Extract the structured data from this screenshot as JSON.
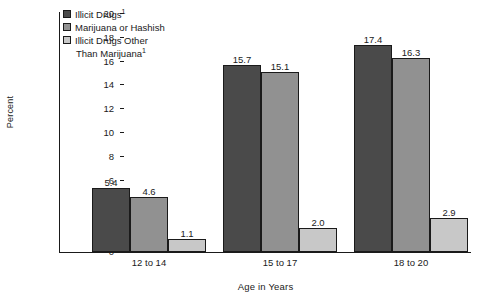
{
  "chart_data": {
    "type": "bar",
    "title": "",
    "xlabel": "Age in Years",
    "ylabel": "Percent",
    "categories": [
      "12 to 14",
      "15 to 17",
      "18 to 20"
    ],
    "series": [
      {
        "name": "Illicit Drugs1",
        "values": [
          5.4,
          15.7,
          17.4
        ],
        "color": "#4a4a4a"
      },
      {
        "name": "Marijuana or Hashish",
        "values": [
          4.6,
          15.1,
          16.3
        ],
        "color": "#919191"
      },
      {
        "name": "Illicit Drugs Other Than Marijuana1",
        "values": [
          1.1,
          2.0,
          2.9
        ],
        "color": "#c8c8c8"
      }
    ],
    "value_labels": [
      [
        "5.4",
        "4.6",
        "1.1"
      ],
      [
        "15.7",
        "15.1",
        "2.0"
      ],
      [
        "17.4",
        "16.3",
        "2.9"
      ]
    ],
    "ylim": [
      0,
      20
    ],
    "ytick_values": [
      20,
      18,
      16,
      14,
      12,
      10,
      8,
      6,
      4,
      2,
      0
    ],
    "ytick_labels": [
      "20",
      "18",
      "16",
      "14",
      "12",
      "10",
      "8",
      "6",
      "4",
      "2",
      "0"
    ],
    "grid": false,
    "legend_position": "top-left"
  },
  "legend": {
    "entries": [
      {
        "label": "Illicit Drugs",
        "footnote": "1",
        "continuation": "",
        "color": "#4a4a4a"
      },
      {
        "label": "Marijuana or Hashish",
        "footnote": "",
        "continuation": "",
        "color": "#919191"
      },
      {
        "label": "Illicit Drugs Other",
        "footnote": "",
        "continuation": "Than Marijuana",
        "continuation_footnote": "1",
        "color": "#c8c8c8"
      }
    ]
  },
  "axes": {
    "y_title": "Percent",
    "x_title": "Age in Years"
  }
}
